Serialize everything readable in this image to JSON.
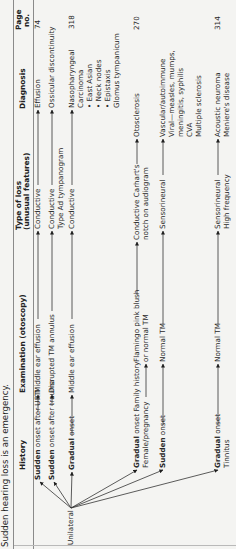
{
  "title": "Sudden hearing loss is an emergency.",
  "headers": {
    "history": "History",
    "examination": "Examination (otoscopy)",
    "type_line1": "Type of loss",
    "type_line2": "(unusual features)",
    "diagnosis": "Diagnosis",
    "page_line1": "Page",
    "page_line2": "no."
  },
  "root_label": "Unilateral",
  "rows": [
    {
      "history_bold": "Sudden",
      "history_rest": " onset after URTI",
      "examination": [
        "Middle ear effusion"
      ],
      "type": [
        "Conductive"
      ],
      "diagnosis": [
        "Effusion"
      ],
      "page": "74"
    },
    {
      "history_bold": "Sudden",
      "history_rest": " onset after trauma",
      "examination": [
        "Disrupted TM annulus"
      ],
      "type": [
        "Conductive",
        "Type Ad tympanogram"
      ],
      "diagnosis": [
        "Ossicular discontinuity"
      ],
      "page": ""
    },
    {
      "history_bold": "Gradual",
      "history_rest": " onset",
      "examination": [
        "Middle ear effusion"
      ],
      "type": [
        "Conductive"
      ],
      "diagnosis": [
        "Nasopharyngeal",
        "Carcinoma",
        "• East Asian",
        "• Neck nodes",
        "• Epistaxis",
        "Glomus tympanicum"
      ],
      "page": "318"
    },
    {
      "history_bold": "Gradual",
      "history_rest": " onset Family history",
      "history_line2": "Female/pregnancy",
      "examination": [
        "Flamingo pink blush",
        "or normal TM"
      ],
      "type": [
        "Conductive Carhart's",
        "notch on audiogram"
      ],
      "diagnosis": [
        "Otosclerosis"
      ],
      "page": "270"
    },
    {
      "history_bold": "Sudden",
      "history_rest": " onset",
      "examination": [
        "Normal TM"
      ],
      "type": [
        "Sensorineural"
      ],
      "diagnosis": [
        "Vascular/autoimmune",
        "Viral—measles, mumps,",
        "meningitis, syphilis",
        "CVA",
        "Multiple sclerosis"
      ],
      "page": ""
    },
    {
      "history_bold": "Gradual",
      "history_rest": " onset",
      "history_line2": "Tinnitus",
      "examination": [
        "Normal TM"
      ],
      "type": [
        "Sensorineural",
        "High frequency"
      ],
      "diagnosis": [
        "Acoustic neuroma",
        "Meniere's disease"
      ],
      "page": "314"
    }
  ],
  "colors": {
    "text": "#2a2a2a",
    "rule": "#8a8a8a",
    "background": "#f4f4f2"
  }
}
